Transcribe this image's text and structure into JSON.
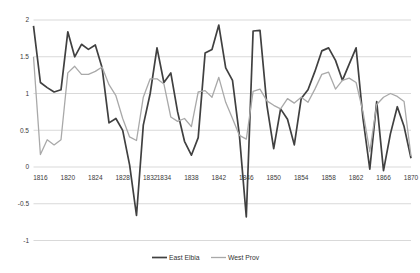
{
  "chart_data": {
    "type": "line",
    "title": "",
    "xlabel": "",
    "ylabel": "",
    "ylim": [
      -1,
      2
    ],
    "y_tick_step": 0.5,
    "y_tick_labels": [
      "2",
      "1.5",
      "1",
      "0.5",
      "0",
      "-0.5",
      "-1"
    ],
    "x": [
      1815,
      1816,
      1817,
      1818,
      1819,
      1820,
      1821,
      1822,
      1823,
      1824,
      1825,
      1826,
      1827,
      1828,
      1829,
      1830,
      1831,
      1832,
      1833,
      1834,
      1835,
      1836,
      1837,
      1838,
      1839,
      1840,
      1841,
      1842,
      1843,
      1844,
      1845,
      1846,
      1847,
      1848,
      1849,
      1850,
      1851,
      1852,
      1853,
      1854,
      1855,
      1856,
      1857,
      1858,
      1859,
      1860,
      1861,
      1862,
      1863,
      1864,
      1865,
      1866,
      1867,
      1868,
      1869,
      1870
    ],
    "x_tick_labels": [
      "1816",
      "1820",
      "1824",
      "1828",
      "1832",
      "1834",
      "1838",
      "1842",
      "1846",
      "1850",
      "1854",
      "1858",
      "1862",
      "1866",
      "1870"
    ],
    "x_tick_years": [
      1816,
      1820,
      1824,
      1828,
      1832,
      1834,
      1838,
      1842,
      1846,
      1850,
      1854,
      1858,
      1862,
      1866,
      1870
    ],
    "grid": "horizontal",
    "legend_position": "bottom-center",
    "series": [
      {
        "name": "East Elbia",
        "color": "#404040",
        "stroke_width": 1.7,
        "values": [
          1.92,
          1.15,
          1.08,
          1.02,
          1.05,
          1.84,
          1.5,
          1.67,
          1.6,
          1.66,
          1.35,
          0.6,
          0.66,
          0.5,
          0.03,
          -0.66,
          0.57,
          1.0,
          1.62,
          1.15,
          1.28,
          0.75,
          0.35,
          0.16,
          0.4,
          1.55,
          1.6,
          1.93,
          1.35,
          1.18,
          0.43,
          -0.68,
          1.85,
          1.86,
          0.84,
          0.25,
          0.79,
          0.65,
          0.3,
          0.93,
          1.05,
          1.3,
          1.58,
          1.62,
          1.45,
          1.18,
          1.4,
          1.62,
          0.66,
          -0.03,
          0.89,
          -0.05,
          0.45,
          0.82,
          0.55,
          0.12
        ]
      },
      {
        "name": "West  Prov",
        "color": "#a9a9a9",
        "stroke_width": 1.3,
        "values": [
          1.5,
          0.17,
          0.37,
          0.3,
          0.37,
          1.28,
          1.37,
          1.26,
          1.26,
          1.3,
          1.36,
          1.12,
          0.97,
          0.66,
          0.41,
          0.36,
          0.95,
          1.2,
          1.2,
          1.13,
          0.68,
          0.62,
          0.66,
          0.55,
          1.02,
          1.04,
          0.95,
          1.22,
          0.88,
          0.66,
          0.43,
          0.38,
          1.03,
          1.06,
          0.9,
          0.84,
          0.79,
          0.93,
          0.87,
          0.95,
          0.88,
          1.06,
          1.26,
          1.29,
          1.06,
          1.18,
          1.21,
          1.15,
          0.75,
          0.21,
          0.85,
          0.95,
          1.0,
          0.96,
          0.89,
          0.15
        ]
      }
    ],
    "gridline_color": "#d9d9d9",
    "background_color": "#ffffff"
  },
  "legend": {
    "items": [
      {
        "label": "East Elbia"
      },
      {
        "label": "West  Prov"
      }
    ]
  }
}
